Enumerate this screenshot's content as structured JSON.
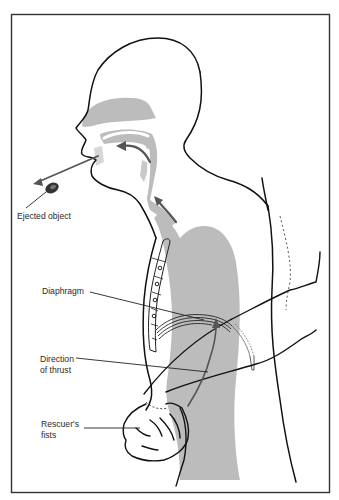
{
  "diagram": {
    "colors": {
      "line": "#111111",
      "shading": "#b9b9b9",
      "arrow": "#555555",
      "frame": "#333333",
      "label": "#2a2a2a"
    },
    "labels": {
      "ejected_object": "Ejected object",
      "diaphragm": "Diaphragm",
      "direction_line1": "Direction",
      "direction_line2": "of thrust",
      "fists_line1": "Rescuer's",
      "fists_line2": "fists"
    }
  }
}
